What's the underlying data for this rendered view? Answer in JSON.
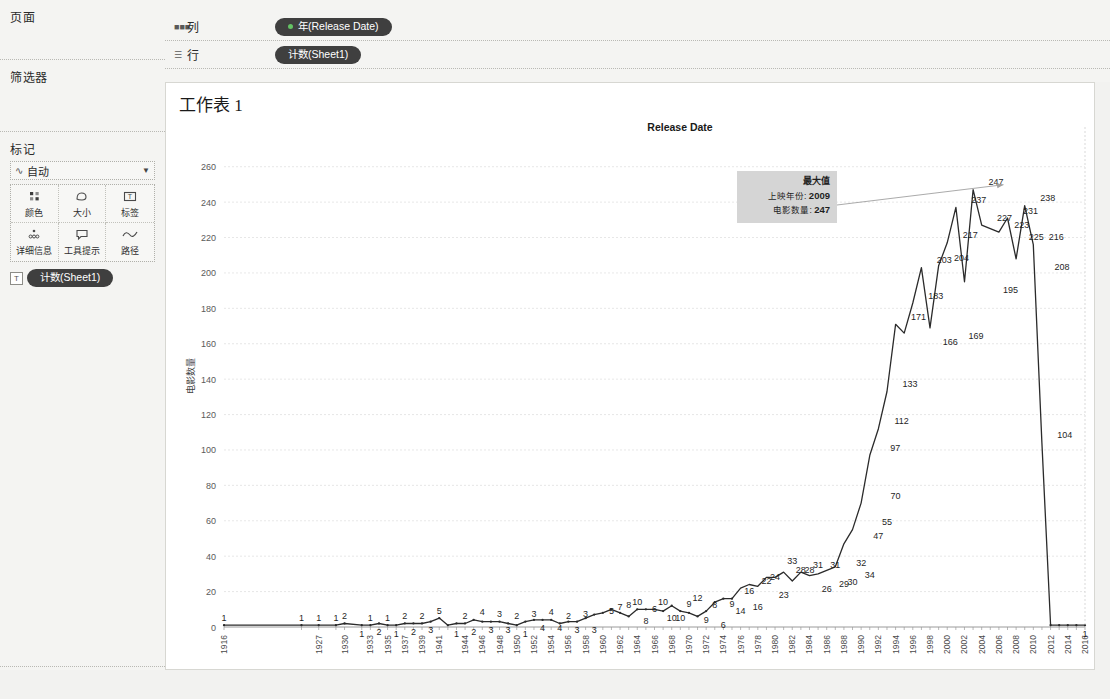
{
  "left_panel": {
    "pages_label": "页面",
    "filters_label": "筛选器",
    "marks_label": "标记",
    "marks_type": "自动",
    "marks_type_icon": "line-mark-icon",
    "mark_cells": [
      {
        "label": "颜色",
        "icon": "color-icon"
      },
      {
        "label": "大小",
        "icon": "size-icon"
      },
      {
        "label": "标签",
        "icon": "label-icon"
      },
      {
        "label": "详细信息",
        "icon": "detail-icon"
      },
      {
        "label": "工具提示",
        "icon": "tooltip-icon"
      },
      {
        "label": "路径",
        "icon": "path-icon"
      }
    ],
    "marks_pill": "计数(Sheet1)",
    "marks_pill_icon": "label-card-icon"
  },
  "shelves": {
    "columns_label": "列",
    "columns_icon": "columns-icon",
    "columns_pill": "年(Release Date)",
    "rows_label": "行",
    "rows_icon": "rows-icon",
    "rows_pill": "计数(Sheet1)"
  },
  "view": {
    "sheet_title": "工作表 1",
    "annotation": {
      "title": "最大值",
      "line1_label": "上映年份:",
      "line1_value": "2009",
      "line2_label": "电影数量:",
      "line2_value": "247"
    }
  },
  "colors": {
    "line": "#2b2b2b",
    "panel_bg": "#f4f4f2",
    "canvas_bg": "#ffffff",
    "pill_bg": "#3f3f3f",
    "annot_bg": "#d5d5d5",
    "grid": "#dcdcdc"
  },
  "chart_data": {
    "type": "line",
    "title": "Release Date",
    "xlabel": "",
    "ylabel": "电影数量",
    "ylim": [
      0,
      270
    ],
    "yticks": [
      0,
      20,
      40,
      60,
      80,
      100,
      120,
      140,
      160,
      180,
      200,
      220,
      240,
      260
    ],
    "grid": true,
    "legend": "none",
    "show_point_labels": true,
    "xtick_labels": [
      "1916",
      "1927",
      "1930",
      "1933",
      "1935",
      "1937",
      "1939",
      "1941",
      "1944",
      "1946",
      "1948",
      "1950",
      "1952",
      "1954",
      "1956",
      "1958",
      "1960",
      "1962",
      "1964",
      "1966",
      "1968",
      "1970",
      "1972",
      "1974",
      "1976",
      "1978",
      "1980",
      "1982",
      "1984",
      "1986",
      "1988",
      "1990",
      "1992",
      "1994",
      "1996",
      "1998",
      "2000",
      "2002",
      "2004",
      "2006",
      "2008",
      "2010",
      "2012",
      "2014",
      "2016"
    ],
    "x": [
      1916,
      1925,
      1927,
      1929,
      1930,
      1932,
      1933,
      1934,
      1935,
      1936,
      1937,
      1938,
      1939,
      1940,
      1941,
      1942,
      1943,
      1944,
      1945,
      1946,
      1947,
      1948,
      1949,
      1950,
      1951,
      1952,
      1953,
      1954,
      1955,
      1956,
      1957,
      1958,
      1959,
      1960,
      1961,
      1962,
      1963,
      1964,
      1965,
      1966,
      1967,
      1968,
      1969,
      1970,
      1971,
      1972,
      1973,
      1974,
      1975,
      1976,
      1977,
      1978,
      1979,
      1980,
      1981,
      1982,
      1983,
      1984,
      1985,
      1986,
      1987,
      1988,
      1989,
      1990,
      1991,
      1992,
      1993,
      1994,
      1995,
      1996,
      1997,
      1998,
      1999,
      2000,
      2001,
      2002,
      2003,
      2004,
      2005,
      2006,
      2007,
      2008,
      2009,
      2010,
      2011,
      2012,
      2013,
      2014,
      2015,
      2016
    ],
    "values": [
      1,
      1,
      1,
      1,
      2,
      1,
      1,
      2,
      1,
      1,
      2,
      2,
      2,
      3,
      5,
      1,
      2,
      2,
      4,
      3,
      3,
      3,
      2,
      1,
      3,
      4,
      4,
      4,
      2,
      3,
      3,
      5,
      7,
      8,
      10,
      8,
      6,
      10,
      10,
      10,
      9,
      12,
      9,
      8,
      6,
      9,
      14,
      16,
      16,
      22,
      24,
      23,
      28,
      28,
      31,
      26,
      31,
      29,
      30,
      32,
      34,
      47,
      55,
      70,
      97,
      112,
      133,
      171,
      166,
      183,
      203,
      169,
      204,
      217,
      237,
      195,
      247,
      227,
      225,
      223,
      231,
      208,
      238,
      216,
      104,
      1,
      1,
      1,
      1,
      1
    ],
    "labeled_points": [
      {
        "x": 1916,
        "y": 1
      },
      {
        "x": 1925,
        "y": 1
      },
      {
        "x": 1927,
        "y": 1
      },
      {
        "x": 1929,
        "y": 1
      },
      {
        "x": 1930,
        "y": 2
      },
      {
        "x": 1932,
        "y": 1
      },
      {
        "x": 1933,
        "y": 1
      },
      {
        "x": 1934,
        "y": 2
      },
      {
        "x": 1935,
        "y": 1
      },
      {
        "x": 1936,
        "y": 1
      },
      {
        "x": 1937,
        "y": 2
      },
      {
        "x": 1938,
        "y": 2
      },
      {
        "x": 1939,
        "y": 2
      },
      {
        "x": 1940,
        "y": 3
      },
      {
        "x": 1941,
        "y": 5
      },
      {
        "x": 1943,
        "y": 1
      },
      {
        "x": 1944,
        "y": 2
      },
      {
        "x": 1945,
        "y": 2
      },
      {
        "x": 1946,
        "y": 4
      },
      {
        "x": 1947,
        "y": 3
      },
      {
        "x": 1948,
        "y": 3
      },
      {
        "x": 1949,
        "y": 3
      },
      {
        "x": 1950,
        "y": 2
      },
      {
        "x": 1951,
        "y": 1
      },
      {
        "x": 1952,
        "y": 3
      },
      {
        "x": 1953,
        "y": 4
      },
      {
        "x": 1954,
        "y": 4
      },
      {
        "x": 1955,
        "y": 4
      },
      {
        "x": 1956,
        "y": 2
      },
      {
        "x": 1957,
        "y": 3
      },
      {
        "x": 1958,
        "y": 3
      },
      {
        "x": 1959,
        "y": 3
      },
      {
        "x": 1961,
        "y": 5
      },
      {
        "x": 1962,
        "y": 7
      },
      {
        "x": 1963,
        "y": 8
      },
      {
        "x": 1964,
        "y": 10
      },
      {
        "x": 1965,
        "y": 8
      },
      {
        "x": 1966,
        "y": 6
      },
      {
        "x": 1967,
        "y": 10
      },
      {
        "x": 1968,
        "y": 10
      },
      {
        "x": 1969,
        "y": 10
      },
      {
        "x": 1970,
        "y": 9
      },
      {
        "x": 1971,
        "y": 12
      },
      {
        "x": 1972,
        "y": 9
      },
      {
        "x": 1973,
        "y": 8
      },
      {
        "x": 1974,
        "y": 6
      },
      {
        "x": 1975,
        "y": 9
      },
      {
        "x": 1976,
        "y": 14
      },
      {
        "x": 1977,
        "y": 16
      },
      {
        "x": 1978,
        "y": 16
      },
      {
        "x": 1979,
        "y": 22
      },
      {
        "x": 1980,
        "y": 24
      },
      {
        "x": 1981,
        "y": 23
      },
      {
        "x": 1982,
        "y": 33
      },
      {
        "x": 1983,
        "y": 28
      },
      {
        "x": 1984,
        "y": 28
      },
      {
        "x": 1985,
        "y": 31
      },
      {
        "x": 1986,
        "y": 26
      },
      {
        "x": 1987,
        "y": 31
      },
      {
        "x": 1988,
        "y": 29
      },
      {
        "x": 1989,
        "y": 30
      },
      {
        "x": 1990,
        "y": 32
      },
      {
        "x": 1991,
        "y": 34
      },
      {
        "x": 1992,
        "y": 47
      },
      {
        "x": 1993,
        "y": 55
      },
      {
        "x": 1994,
        "y": 70
      },
      {
        "x": 1995,
        "y": 97
      },
      {
        "x": 1996,
        "y": 112
      },
      {
        "x": 1997,
        "y": 133
      },
      {
        "x": 1998,
        "y": 171
      },
      {
        "x": 1999,
        "y": 166
      },
      {
        "x": 2000,
        "y": 183
      },
      {
        "x": 2001,
        "y": 203
      },
      {
        "x": 2002,
        "y": 169
      },
      {
        "x": 2003,
        "y": 204
      },
      {
        "x": 2004,
        "y": 217
      },
      {
        "x": 2005,
        "y": 237
      },
      {
        "x": 2006,
        "y": 195
      },
      {
        "x": 2007,
        "y": 247
      },
      {
        "x": 2008,
        "y": 227
      },
      {
        "x": 2009,
        "y": 225
      },
      {
        "x": 2010,
        "y": 223
      },
      {
        "x": 2011,
        "y": 231
      },
      {
        "x": 2012,
        "y": 208
      },
      {
        "x": 2013,
        "y": 238
      },
      {
        "x": 2014,
        "y": 216
      },
      {
        "x": 2015,
        "y": 104
      },
      {
        "x": 2016,
        "y": 1
      }
    ],
    "max_point": {
      "x": 2009,
      "y": 247,
      "note": "最大值"
    }
  }
}
